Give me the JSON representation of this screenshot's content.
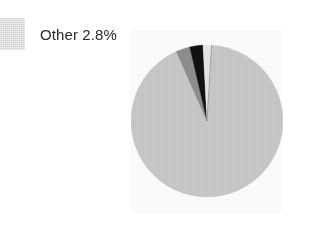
{
  "chart_data": {
    "type": "pie",
    "title": "",
    "subtitle": "",
    "xlabel": "",
    "ylabel": "",
    "grid": false,
    "legend_position": "top-left",
    "start_angle_deg": 0,
    "direction": "clockwise",
    "categories": [
      "Main",
      "Segment B",
      "Other",
      "Sliver"
    ],
    "values": [
      92.4,
      3.0,
      2.8,
      1.8
    ],
    "slices": [
      {
        "label": "Main",
        "value": 92.4,
        "display": "",
        "color": "#c9c9c9",
        "start_deg": 3.5,
        "end_deg": 336.1
      },
      {
        "label": "Segment B",
        "value": 3.0,
        "display": "",
        "color": "#8f8f8f",
        "start_deg": 336.1,
        "end_deg": 346.9
      },
      {
        "label": "Other",
        "value": 2.8,
        "display": "2.8%",
        "color": "#111111",
        "start_deg": 346.9,
        "end_deg": 357.0
      },
      {
        "label": "Sliver",
        "value": 1.8,
        "display": "",
        "color": "#e8e8e8",
        "start_deg": 357.0,
        "end_deg": 363.5
      }
    ]
  },
  "legend": {
    "entries": [
      {
        "label": "Other 2.8%",
        "swatch_color": "#d2d2d2"
      }
    ]
  },
  "colors": {
    "background": "#ffffff",
    "text": "#2b2b2b",
    "main_slice": "#c9c9c9",
    "secondary_slice": "#8f8f8f",
    "other_slice": "#111111",
    "sliver_slice": "#e8e8e8",
    "slice_divider": "#9a9a9a"
  }
}
